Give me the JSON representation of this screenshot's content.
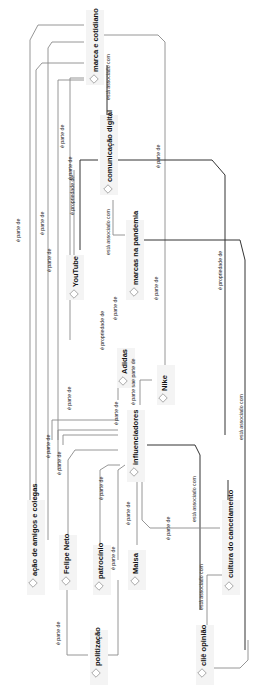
{
  "diagram": {
    "orientation": "rotated-90-ccw",
    "colors": {
      "edge": "#8a8a8a",
      "edge_dark": "#333333",
      "node_bg": "#f4f4f4",
      "text": "#111111"
    },
    "nodes": [
      {
        "id": "marca",
        "label": "marca e cotidiano",
        "x": 96,
        "y": 40
      },
      {
        "id": "comdig",
        "label": "comunicação digital",
        "x": 110,
        "y": 150
      },
      {
        "id": "youtube",
        "label": "YouTube",
        "x": 75,
        "y": 270
      },
      {
        "id": "pandemia",
        "label": "marcas na pandemia",
        "x": 135,
        "y": 255
      },
      {
        "id": "adidas",
        "label": "Adidas",
        "x": 125,
        "y": 370
      },
      {
        "id": "nike",
        "label": "Nike",
        "x": 165,
        "y": 390
      },
      {
        "id": "influ",
        "label": "influenciadores",
        "x": 135,
        "y": 440
      },
      {
        "id": "amigos",
        "label": "ação de amigos e colegas",
        "x": 35,
        "y": 550
      },
      {
        "id": "felipe",
        "label": "Felipe Neto",
        "x": 67,
        "y": 555
      },
      {
        "id": "patro",
        "label": "patrocínio",
        "x": 100,
        "y": 570
      },
      {
        "id": "maisa",
        "label": "Maisa",
        "x": 137,
        "y": 570
      },
      {
        "id": "cultura",
        "label": "cultura do cancelamento",
        "x": 232,
        "y": 560
      },
      {
        "id": "polit",
        "label": "politização",
        "x": 97,
        "y": 655
      },
      {
        "id": "cliu",
        "label": "cliê opinião",
        "x": 203,
        "y": 650
      }
    ],
    "edge_labels": [
      {
        "text": "está associado com",
        "x": 110,
        "y": 80
      },
      {
        "text": "é parte de",
        "x": 63,
        "y": 140
      },
      {
        "text": "é parte de",
        "x": 60,
        "y": 175
      },
      {
        "text": "é propriedade de",
        "x": 74,
        "y": 195
      },
      {
        "text": "é parte de",
        "x": 158,
        "y": 155
      },
      {
        "text": "é parte de",
        "x": 20,
        "y": 240
      },
      {
        "text": "é parte de",
        "x": 45,
        "y": 225
      },
      {
        "text": "é parte de",
        "x": 50,
        "y": 245
      },
      {
        "text": "está associado com",
        "x": 108,
        "y": 250
      },
      {
        "text": "é propriedade de",
        "x": 222,
        "y": 280
      },
      {
        "text": "é parte de",
        "x": 116,
        "y": 305
      },
      {
        "text": "é parte de",
        "x": 158,
        "y": 300
      },
      {
        "text": "é propriedade de",
        "x": 103,
        "y": 330
      },
      {
        "text": "é parte de",
        "x": 70,
        "y": 405
      },
      {
        "text": "é parte sae parte de",
        "x": 134,
        "y": 375
      },
      {
        "text": "é parte de",
        "x": 118,
        "y": 415
      },
      {
        "text": "está associado com",
        "x": 242,
        "y": 430
      },
      {
        "text": "é parte de",
        "x": 50,
        "y": 455
      },
      {
        "text": "é parte de",
        "x": 80,
        "y": 455
      },
      {
        "text": "é parte de",
        "x": 100,
        "y": 480
      },
      {
        "text": "é parte de",
        "x": 130,
        "y": 510
      },
      {
        "text": "é parte de",
        "x": 170,
        "y": 530
      },
      {
        "text": "está associado com",
        "x": 193,
        "y": 510
      },
      {
        "text": "é parte de",
        "x": 110,
        "y": 560
      },
      {
        "text": "é parte de",
        "x": 60,
        "y": 620
      },
      {
        "text": "está associado com",
        "x": 200,
        "y": 600
      }
    ]
  }
}
